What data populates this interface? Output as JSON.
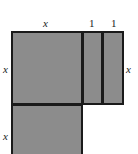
{
  "figure": {
    "fill_color": "#8c8c8c",
    "stroke_color": "#1a1a1a",
    "background_color": "#ffffff",
    "labels": {
      "top_x": "x",
      "top_one_a": "1",
      "top_one_b": "1",
      "left_x": "x",
      "right_x": "x",
      "lower_x": "x"
    },
    "regions": [
      {
        "name": "top-left-square",
        "width_label": "x",
        "height_label": "x"
      },
      {
        "name": "first-unit-strip",
        "width_label": "1",
        "height_label": "x"
      },
      {
        "name": "second-unit-strip",
        "width_label": "1",
        "height_label": "x"
      },
      {
        "name": "bottom-left-square",
        "width_label": "x",
        "height_label": "x"
      }
    ]
  }
}
